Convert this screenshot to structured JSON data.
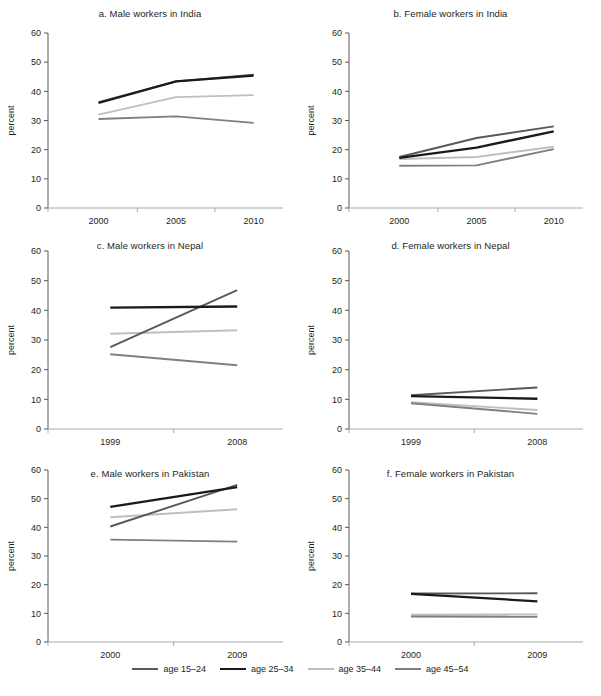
{
  "figure": {
    "ylabel": "percent",
    "y_ticks": [
      0,
      10,
      20,
      30,
      40,
      50,
      60
    ],
    "ylim": [
      0,
      60
    ]
  },
  "legend": {
    "position": "bottom-center",
    "items": [
      {
        "label": "age 15–24",
        "color": "#595959"
      },
      {
        "label": "age 25–34",
        "color": "#1a1a1a"
      },
      {
        "label": "age 35–44",
        "color": "#bfbfbf"
      },
      {
        "label": "age 45–54",
        "color": "#7f7f7f"
      }
    ]
  },
  "chart_data": [
    {
      "type": "line",
      "panel": "a",
      "title": "a.  Male workers in India",
      "xlabel": "",
      "ylabel": "percent",
      "ylim": [
        0,
        60
      ],
      "categories": [
        "2000",
        "2005",
        "2010"
      ],
      "x": [
        2000,
        2005,
        2010
      ],
      "series": [
        {
          "name": "age 15–24",
          "color": "#595959",
          "values": [
            36.3,
            43.4,
            45.7
          ]
        },
        {
          "name": "age 25–34",
          "color": "#1a1a1a",
          "values": [
            36.0,
            43.4,
            45.4
          ]
        },
        {
          "name": "age 35–44",
          "color": "#bfbfbf",
          "values": [
            32.0,
            38.0,
            38.7
          ]
        },
        {
          "name": "age 45–54",
          "color": "#7f7f7f",
          "values": [
            30.5,
            31.4,
            29.2
          ]
        }
      ]
    },
    {
      "type": "line",
      "panel": "b",
      "title": "b.  Female workers in India",
      "xlabel": "",
      "ylabel": "percent",
      "ylim": [
        0,
        60
      ],
      "categories": [
        "2000",
        "2005",
        "2010"
      ],
      "x": [
        2000,
        2005,
        2010
      ],
      "series": [
        {
          "name": "age 15–24",
          "color": "#595959",
          "values": [
            17.5,
            24.0,
            28.0
          ]
        },
        {
          "name": "age 25–34",
          "color": "#1a1a1a",
          "values": [
            17.2,
            20.7,
            26.3
          ]
        },
        {
          "name": "age 35–44",
          "color": "#bfbfbf",
          "values": [
            16.8,
            17.5,
            21.0
          ]
        },
        {
          "name": "age 45–54",
          "color": "#7f7f7f",
          "values": [
            14.5,
            14.6,
            20.2
          ]
        }
      ]
    },
    {
      "type": "line",
      "panel": "c",
      "title": "c.  Male workers in Nepal",
      "xlabel": "",
      "ylabel": "percent",
      "ylim": [
        0,
        60
      ],
      "categories": [
        "1999",
        "2008"
      ],
      "x": [
        1999,
        2008
      ],
      "series": [
        {
          "name": "age 15–24",
          "color": "#595959",
          "values": [
            27.6,
            46.8
          ]
        },
        {
          "name": "age 25–34",
          "color": "#1a1a1a",
          "values": [
            40.9,
            41.3
          ]
        },
        {
          "name": "age 35–44",
          "color": "#bfbfbf",
          "values": [
            32.1,
            33.3
          ]
        },
        {
          "name": "age 45–54",
          "color": "#7f7f7f",
          "values": [
            25.2,
            21.5
          ]
        }
      ]
    },
    {
      "type": "line",
      "panel": "d",
      "title": "d.  Female workers in Nepal",
      "xlabel": "",
      "ylabel": "percent",
      "ylim": [
        0,
        60
      ],
      "categories": [
        "1999",
        "2008"
      ],
      "x": [
        1999,
        2008
      ],
      "series": [
        {
          "name": "age 15–24",
          "color": "#595959",
          "values": [
            11.4,
            14.0
          ]
        },
        {
          "name": "age 25–34",
          "color": "#1a1a1a",
          "values": [
            11.1,
            10.2
          ]
        },
        {
          "name": "age 35–44",
          "color": "#bfbfbf",
          "values": [
            9.0,
            6.4
          ]
        },
        {
          "name": "age 45–54",
          "color": "#7f7f7f",
          "values": [
            8.7,
            5.1
          ]
        }
      ]
    },
    {
      "type": "line",
      "panel": "e",
      "title": "e.  Male workers in Pakistan",
      "xlabel": "",
      "ylabel": "percent",
      "ylim": [
        0,
        60
      ],
      "categories": [
        "2000",
        "2009"
      ],
      "x": [
        2000,
        2009
      ],
      "series": [
        {
          "name": "age 15–24",
          "color": "#595959",
          "values": [
            40.3,
            54.8
          ]
        },
        {
          "name": "age 25–34",
          "color": "#1a1a1a",
          "values": [
            47.1,
            54.0
          ]
        },
        {
          "name": "age 35–44",
          "color": "#bfbfbf",
          "values": [
            43.5,
            46.3
          ]
        },
        {
          "name": "age 45–54",
          "color": "#7f7f7f",
          "values": [
            35.7,
            35.0
          ]
        }
      ]
    },
    {
      "type": "line",
      "panel": "f",
      "title": "f.  Female workers in Pakistan",
      "xlabel": "",
      "ylabel": "percent",
      "ylim": [
        0,
        60
      ],
      "categories": [
        "2000",
        "2009"
      ],
      "x": [
        2000,
        2009
      ],
      "series": [
        {
          "name": "age 15–24",
          "color": "#595959",
          "values": [
            16.9,
            17.0
          ]
        },
        {
          "name": "age 25–34",
          "color": "#1a1a1a",
          "values": [
            16.8,
            14.2
          ]
        },
        {
          "name": "age 35–44",
          "color": "#bfbfbf",
          "values": [
            9.5,
            9.6
          ]
        },
        {
          "name": "age 45–54",
          "color": "#7f7f7f",
          "values": [
            8.9,
            8.8
          ]
        }
      ]
    }
  ]
}
